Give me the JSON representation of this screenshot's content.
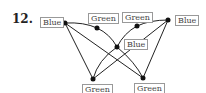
{
  "problem_number": "12.",
  "nodes": [
    {
      "id": "n1",
      "label": "Blue",
      "x": 65,
      "y": 23,
      "lx": 40,
      "ly": 17
    },
    {
      "id": "n2",
      "label": "Green",
      "x": 97,
      "y": 28,
      "lx": 88,
      "ly": 13
    },
    {
      "id": "n3",
      "label": "Green",
      "x": 137,
      "y": 26,
      "lx": 122,
      "ly": 12
    },
    {
      "id": "n4",
      "label": "Blue",
      "x": 168,
      "y": 20,
      "lx": 175,
      "ly": 15
    },
    {
      "id": "n5",
      "label": "Blue",
      "x": 117,
      "y": 47,
      "lx": 124,
      "ly": 39
    },
    {
      "id": "n6",
      "label": "Green",
      "x": 93,
      "y": 79,
      "lx": 82,
      "ly": 84
    },
    {
      "id": "n7",
      "label": "Green",
      "x": 143,
      "y": 78,
      "lx": 134,
      "ly": 83
    }
  ],
  "edges": [
    [
      "n1",
      "n2"
    ],
    [
      "n2",
      "n5"
    ],
    [
      "n5",
      "n7"
    ],
    [
      "n4",
      "n3"
    ],
    [
      "n3",
      "n5"
    ],
    [
      "n5",
      "n6"
    ],
    [
      "n1",
      "n6"
    ],
    [
      "n1",
      "n7"
    ],
    [
      "n4",
      "n6"
    ],
    [
      "n4",
      "n7"
    ]
  ]
}
